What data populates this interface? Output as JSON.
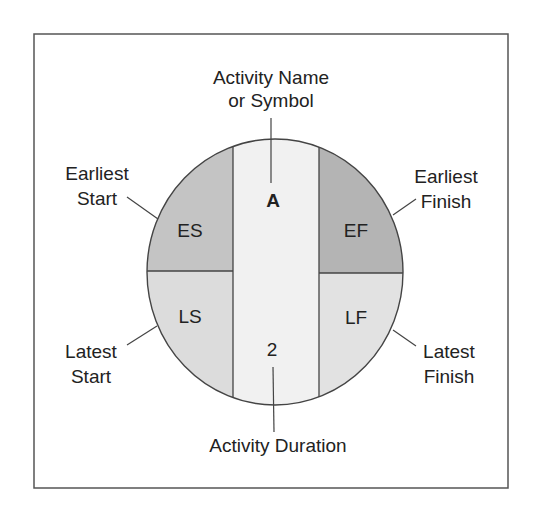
{
  "diagram": {
    "type": "activity-on-node legend",
    "node": {
      "symbol": "A",
      "duration": "2",
      "quadrants": {
        "top_left": "ES",
        "top_right": "EF",
        "bottom_left": "LS",
        "bottom_right": "LF"
      }
    },
    "callouts": {
      "top": {
        "line1": "Activity Name",
        "line2": "or Symbol"
      },
      "bottom": {
        "line1": "Activity Duration"
      },
      "earliest_start": {
        "line1": "Earliest",
        "line2": "Start"
      },
      "earliest_finish": {
        "line1": "Earliest",
        "line2": "Finish"
      },
      "latest_start": {
        "line1": "Latest",
        "line2": "Start"
      },
      "latest_finish": {
        "line1": "Latest",
        "line2": "Finish"
      }
    },
    "colors": {
      "es_fill": "#c4c4c4",
      "ef_fill": "#b4b4b4",
      "ls_fill": "#dcdcdc",
      "lf_fill": "#e2e2e2",
      "center_fill": "#f1f1f1",
      "stroke": "#444444",
      "frame": "#555555"
    }
  }
}
